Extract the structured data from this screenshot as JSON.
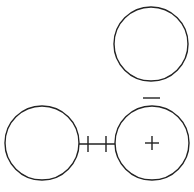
{
  "diagram": {
    "stroke_color": "#222222",
    "stroke_width": 1.4,
    "circles": [
      {
        "id": "top-circle",
        "cx": 151,
        "cy": 44,
        "r": 37
      },
      {
        "id": "left-circle",
        "cx": 42,
        "cy": 143,
        "r": 37
      },
      {
        "id": "right-circle",
        "cx": 152,
        "cy": 143,
        "r": 37
      }
    ],
    "connector": {
      "x1": 79,
      "y1": 144,
      "x2": 115,
      "y2": 144
    },
    "connector_ticks": [
      {
        "x": 88,
        "y1": 136,
        "y2": 152
      },
      {
        "x": 106,
        "y1": 136,
        "y2": 152
      }
    ],
    "minus_sign": {
      "x1": 143,
      "x2": 160,
      "y": 98
    },
    "plus_sign": {
      "cx": 152,
      "cy": 143,
      "half": 7
    }
  },
  "caption": {
    "text": ""
  }
}
